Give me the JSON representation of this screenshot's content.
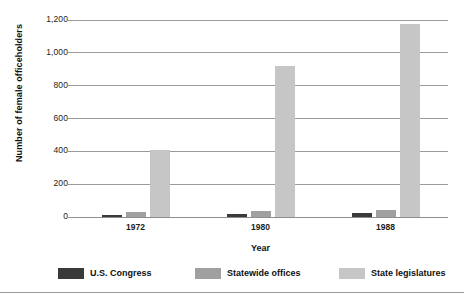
{
  "chart_data": {
    "type": "bar",
    "title": "",
    "subtitle": "",
    "xlabel": "Year",
    "ylabel": "Number of female officeholders",
    "categories": [
      "1972",
      "1980",
      "1988"
    ],
    "series": [
      {
        "name": "U.S. Congress",
        "color": "#3a3a3a",
        "values": [
          14,
          16,
          25
        ]
      },
      {
        "name": "Statewide offices",
        "color": "#a0a0a0",
        "values": [
          30,
          37,
          43
        ]
      },
      {
        "name": "State legislatures",
        "color": "#c6c6c6",
        "values": [
          410,
          920,
          1175
        ]
      }
    ],
    "ylim": [
      0,
      1200
    ],
    "yticks": [
      0,
      200,
      400,
      600,
      800,
      1000,
      1200
    ],
    "ytick_labels": [
      "0",
      "200",
      "400",
      "600",
      "800",
      "1,000",
      "1,200"
    ],
    "grid": true,
    "grid_axis": "y",
    "legend_position": "bottom",
    "grouping": "grouped"
  },
  "axes": {
    "y_title": "Number of female officeholders",
    "x_title": "Year"
  },
  "legend": {
    "entries": [
      {
        "label": "U.S. Congress",
        "swatch": "legend-swatch-dark"
      },
      {
        "label": "Statewide offices",
        "swatch": "legend-swatch-medium"
      },
      {
        "label": "State legislatures",
        "swatch": "legend-swatch-light"
      }
    ]
  }
}
